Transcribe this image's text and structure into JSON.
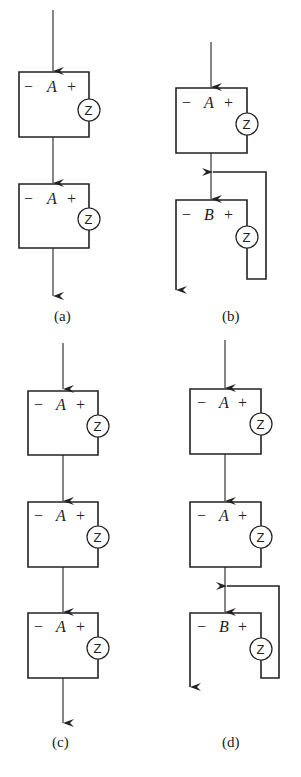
{
  "figure": {
    "panels": [
      {
        "id": "a",
        "caption": "(a)",
        "blocks": [
          {
            "minus": "−",
            "name": "A",
            "plus": "+",
            "zener": "Z"
          },
          {
            "minus": "−",
            "name": "A",
            "plus": "+",
            "zener": "Z"
          }
        ]
      },
      {
        "id": "b",
        "caption": "(b)",
        "blocks": [
          {
            "minus": "−",
            "name": "A",
            "plus": "+",
            "zener": "Z"
          },
          {
            "minus": "−",
            "name": "B",
            "plus": "+",
            "zener": "Z"
          }
        ]
      },
      {
        "id": "c",
        "caption": "(c)",
        "blocks": [
          {
            "minus": "−",
            "name": "A",
            "plus": "+",
            "zener": "Z"
          },
          {
            "minus": "−",
            "name": "A",
            "plus": "+",
            "zener": "Z"
          },
          {
            "minus": "−",
            "name": "A",
            "plus": "+",
            "zener": "Z"
          }
        ]
      },
      {
        "id": "d",
        "caption": "(d)",
        "blocks": [
          {
            "minus": "−",
            "name": "A",
            "plus": "+",
            "zener": "Z"
          },
          {
            "minus": "−",
            "name": "A",
            "plus": "+",
            "zener": "Z"
          },
          {
            "minus": "−",
            "name": "B",
            "plus": "+",
            "zener": "Z"
          }
        ]
      }
    ]
  }
}
